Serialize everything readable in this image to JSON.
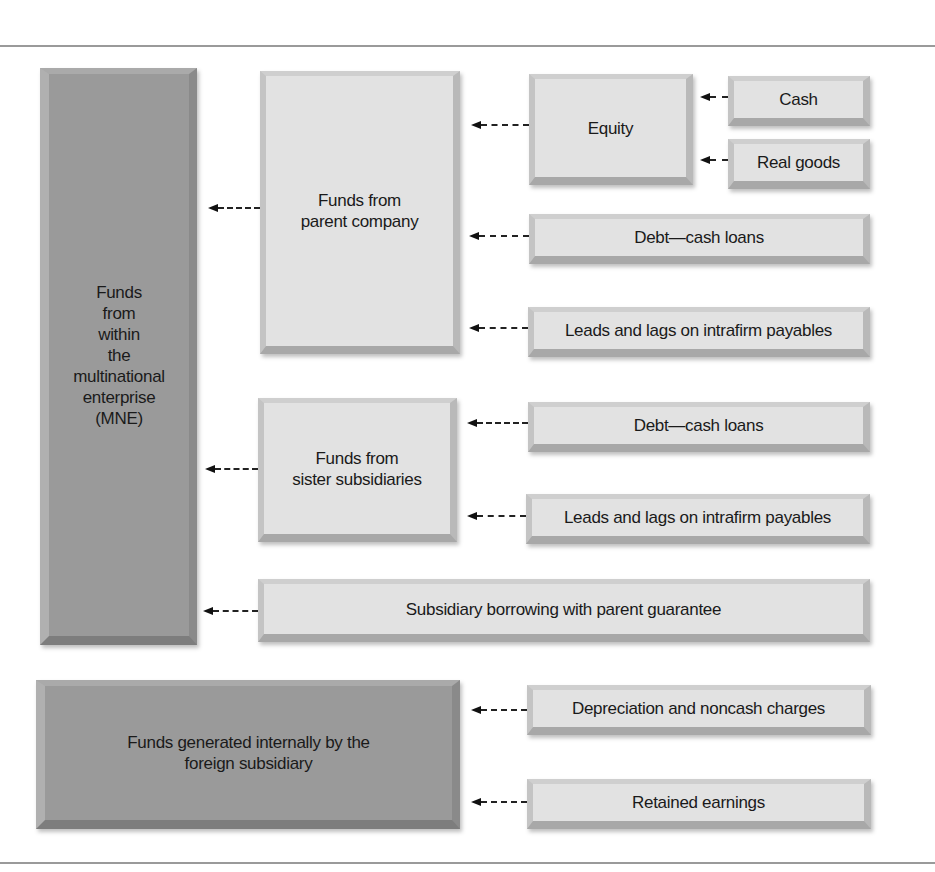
{
  "diagram": {
    "mne_box": {
      "label": "Funds\nfrom\nwithin\nthe\nmultinational\nenterprise\n(MNE)",
      "lines": [
        "Funds",
        "from",
        "within",
        "the",
        "multinational",
        "enterprise",
        "(MNE)"
      ]
    },
    "parent_box": {
      "line1": "Funds from",
      "line2": "parent company"
    },
    "equity_box": {
      "label": "Equity"
    },
    "cash_box": {
      "label": "Cash"
    },
    "real_goods_box": {
      "label": "Real goods"
    },
    "parent_debt_box": {
      "label": "Debt—cash loans"
    },
    "parent_leads_box": {
      "label": "Leads and lags on intrafirm payables"
    },
    "sister_box": {
      "line1": "Funds from",
      "line2": "sister subsidiaries"
    },
    "sister_debt_box": {
      "label": "Debt—cash loans"
    },
    "sister_leads_box": {
      "label": "Leads and lags on intrafirm payables"
    },
    "guarantee_box": {
      "label": "Subsidiary borrowing with parent guarantee"
    },
    "internal_box": {
      "line1": "Funds generated internally by the",
      "line2": "foreign subsidiary"
    },
    "depreciation_box": {
      "label": "Depreciation and noncash charges"
    },
    "retained_box": {
      "label": "Retained earnings"
    }
  },
  "colors": {
    "dark_box": "#9a9a9a",
    "light_box": "#e2e2e2",
    "arrow": "#111111",
    "rule": "#9a9a9a"
  }
}
